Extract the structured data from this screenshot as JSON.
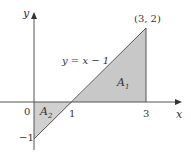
{
  "diagram": {
    "equation_label": "y = x − 1",
    "point_label": "(3, 2)",
    "axis_labels": {
      "x": "x",
      "y": "y"
    },
    "tick_labels": {
      "origin": "0",
      "one": "1",
      "three": "3",
      "neg_one": "−1"
    },
    "regions": [
      {
        "name": "A1",
        "label_main": "A",
        "label_sub": "1"
      },
      {
        "name": "A2",
        "label_main": "A",
        "label_sub": "2"
      }
    ],
    "colors": {
      "fill": "#c8c8c8",
      "line": "#555555",
      "axis": "#555555"
    }
  }
}
